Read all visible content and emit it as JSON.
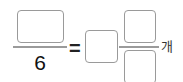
{
  "equation": {
    "left_fraction": {
      "numerator_input": "",
      "denominator": "6"
    },
    "equals": "=",
    "mixed_number": {
      "whole_input": "",
      "numerator_input": "",
      "denominator_input": ""
    },
    "unit": "개"
  },
  "colors": {
    "box_border": "#9a9a9a",
    "text": "#111111"
  }
}
